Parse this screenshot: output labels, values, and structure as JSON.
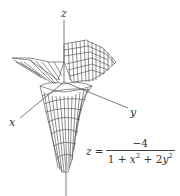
{
  "figure": {
    "type": "3D wireframe surface plot",
    "axes": {
      "x": "x",
      "y": "y",
      "z": "z"
    },
    "equation": {
      "lhs": "z =",
      "numerator": "−4",
      "denominator_parts": [
        "1 + ",
        "x",
        "2",
        " + 2",
        "y",
        "2"
      ]
    },
    "colors": {
      "line": "#444444",
      "background": "#ffffff"
    }
  }
}
